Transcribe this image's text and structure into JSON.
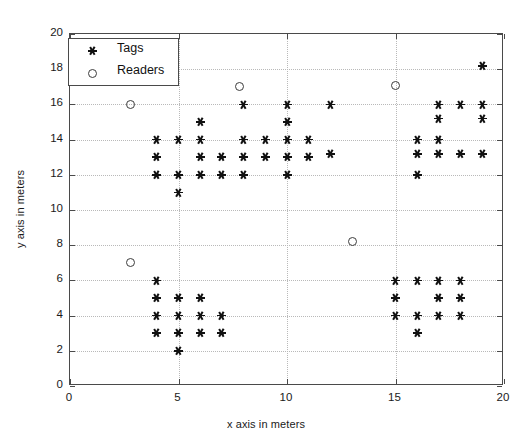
{
  "chart_data": {
    "type": "scatter",
    "title": "",
    "xlabel": "x axis in meters",
    "ylabel": "y axis in meters",
    "xlim": [
      0,
      20
    ],
    "ylim": [
      0,
      20
    ],
    "xticks": [
      0,
      5,
      10,
      15,
      20
    ],
    "yticks": [
      0,
      2,
      4,
      6,
      8,
      10,
      12,
      14,
      16,
      18,
      20
    ],
    "grid": true,
    "legend_position": "upper-left-inside",
    "series": [
      {
        "name": "Tags",
        "marker": "asterisk",
        "color": "#111111",
        "points": [
          [
            4,
            14
          ],
          [
            4,
            13
          ],
          [
            4,
            12
          ],
          [
            5,
            14
          ],
          [
            5,
            12
          ],
          [
            5,
            11
          ],
          [
            6,
            15
          ],
          [
            6,
            14
          ],
          [
            6,
            13
          ],
          [
            6,
            12
          ],
          [
            7,
            13
          ],
          [
            7,
            12
          ],
          [
            8,
            16
          ],
          [
            8,
            14
          ],
          [
            8,
            13
          ],
          [
            8,
            12
          ],
          [
            9,
            14
          ],
          [
            9,
            13
          ],
          [
            10,
            16
          ],
          [
            10,
            15
          ],
          [
            10,
            14
          ],
          [
            10,
            13
          ],
          [
            10,
            12
          ],
          [
            11,
            14
          ],
          [
            11,
            13
          ],
          [
            12,
            16
          ],
          [
            12,
            13.2
          ],
          [
            16,
            14
          ],
          [
            16,
            13.2
          ],
          [
            16,
            12
          ],
          [
            17,
            16
          ],
          [
            17,
            15.2
          ],
          [
            17,
            14
          ],
          [
            17,
            13.2
          ],
          [
            18,
            16
          ],
          [
            18,
            13.2
          ],
          [
            19,
            18.2
          ],
          [
            19,
            16
          ],
          [
            19,
            15.2
          ],
          [
            19,
            13.2
          ],
          [
            4,
            6
          ],
          [
            4,
            5
          ],
          [
            4,
            4
          ],
          [
            4,
            3
          ],
          [
            5,
            5
          ],
          [
            5,
            4
          ],
          [
            5,
            3
          ],
          [
            5,
            2
          ],
          [
            6,
            5
          ],
          [
            6,
            4
          ],
          [
            6,
            3
          ],
          [
            7,
            4
          ],
          [
            7,
            3
          ],
          [
            15,
            6
          ],
          [
            15,
            5
          ],
          [
            15,
            4
          ],
          [
            16,
            6
          ],
          [
            16,
            4
          ],
          [
            16,
            3
          ],
          [
            17,
            6
          ],
          [
            17,
            5
          ],
          [
            17,
            4
          ],
          [
            18,
            6
          ],
          [
            18,
            5
          ],
          [
            18,
            4
          ]
        ]
      },
      {
        "name": "Readers",
        "marker": "circle",
        "color": "#3c3c3c",
        "points": [
          [
            2.8,
            16
          ],
          [
            2.8,
            7
          ],
          [
            7.8,
            17
          ],
          [
            13.0,
            8.2
          ],
          [
            15.0,
            17.1
          ]
        ]
      }
    ]
  },
  "legend": {
    "entries": [
      {
        "label": "Tags",
        "marker": "asterisk"
      },
      {
        "label": "Readers",
        "marker": "circle"
      }
    ]
  },
  "axes": {
    "x_title": "x axis in meters",
    "y_title": "y axis in meters"
  }
}
